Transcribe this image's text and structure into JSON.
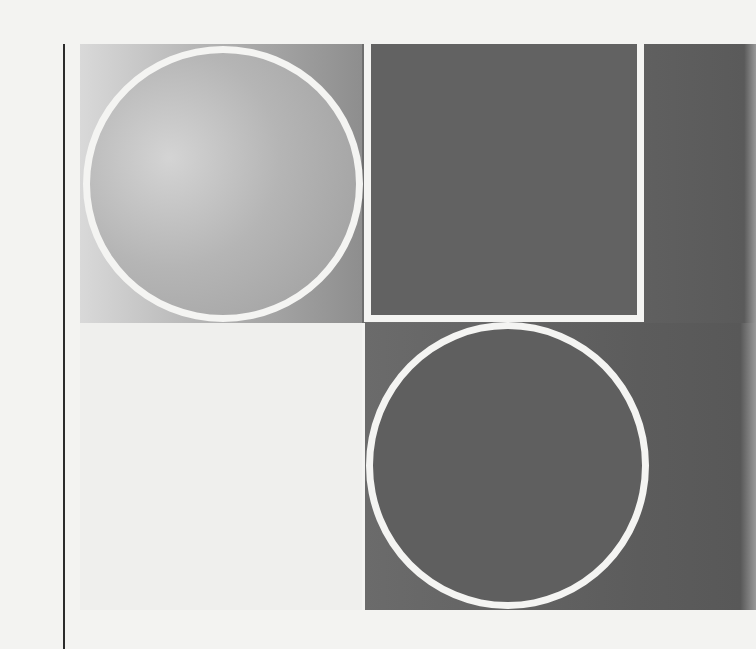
{
  "page": {
    "type": "scanned-print-page",
    "background_color": "#f3f3f1"
  },
  "artwork": {
    "layout": "2x2 grid",
    "outline_color": "#f4f4f2",
    "cells": [
      {
        "position": "top-left",
        "shape": "circle",
        "fill": "light-to-mid gray gradient",
        "colors": [
          "#d9d9d9",
          "#8e8e8e"
        ]
      },
      {
        "position": "top-right",
        "shape": "square-outline",
        "fill": "dark gray",
        "colors": [
          "#626262"
        ]
      },
      {
        "position": "bottom-left",
        "shape": "none",
        "fill": "near-white",
        "colors": [
          "#efefed"
        ]
      },
      {
        "position": "bottom-right",
        "shape": "circle",
        "fill": "dark gray",
        "colors": [
          "#5f5f5f"
        ]
      }
    ]
  },
  "margin_rule": {
    "color": "#2b2b2b"
  }
}
